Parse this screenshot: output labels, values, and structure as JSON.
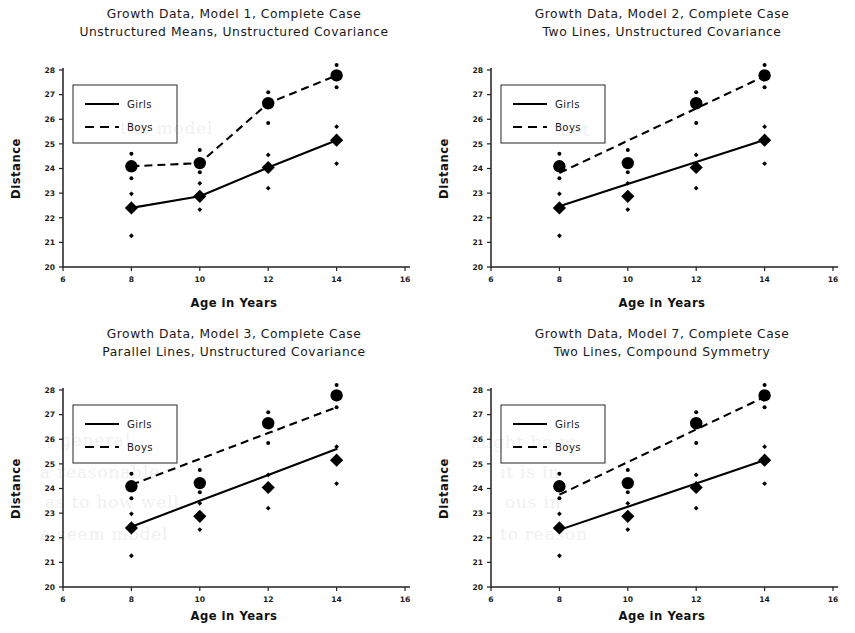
{
  "figure": {
    "background": "#ffffff",
    "ink_color": "#000000",
    "panel_count": 4
  },
  "axes_common": {
    "xlabel": "Age in Years",
    "ylabel": "Distance",
    "xticks": [
      6,
      8,
      10,
      12,
      14,
      16
    ],
    "yticks": [
      20,
      21,
      22,
      23,
      24,
      25,
      26,
      27,
      28
    ],
    "xlim": [
      6,
      16
    ],
    "ylim": [
      20,
      28
    ],
    "grid": false
  },
  "legend_common": {
    "position": "upper-left",
    "entries": [
      {
        "label": "Girls",
        "style": "solid",
        "marker": "diamond"
      },
      {
        "label": "Boys",
        "style": "dashed",
        "marker": "circle"
      }
    ]
  },
  "chart_data": [
    {
      "id": "panel-model-1",
      "type": "line",
      "title": "Growth Data, Model 1, Complete Case",
      "subtitle": "Unstructured Means, Unstructured Covariance",
      "xlabel": "Age in Years",
      "ylabel": "Distance",
      "xlim": [
        6,
        16
      ],
      "ylim": [
        20,
        28
      ],
      "xticks": [
        6,
        8,
        10,
        12,
        14,
        16
      ],
      "yticks": [
        20,
        21,
        22,
        23,
        24,
        25,
        26,
        27,
        28
      ],
      "grid": false,
      "x": [
        8,
        10,
        12,
        14
      ],
      "series": [
        {
          "name": "Girls",
          "style": "solid",
          "marker": "diamond",
          "values": [
            22.4,
            22.87,
            24.04,
            25.15
          ],
          "upper": [
            22.97,
            23.4,
            24.55,
            25.7
          ],
          "lower": [
            21.27,
            22.33,
            23.2,
            24.2
          ],
          "fitted": [
            22.4,
            22.87,
            24.04,
            25.15
          ]
        },
        {
          "name": "Boys",
          "style": "dashed",
          "marker": "circle",
          "values": [
            24.09,
            24.22,
            26.65,
            27.78
          ],
          "upper": [
            24.6,
            24.75,
            27.1,
            28.2
          ],
          "lower": [
            23.6,
            23.85,
            25.85,
            27.3
          ],
          "fitted": [
            24.09,
            24.22,
            26.65,
            27.78
          ]
        }
      ],
      "legend": {
        "position": "upper-left",
        "labels": [
          "Girls",
          "Boys"
        ]
      }
    },
    {
      "id": "panel-model-2",
      "type": "line",
      "title": "Growth Data, Model 2, Complete Case",
      "subtitle": "Two Lines, Unstructured Covariance",
      "xlabel": "Age in Years",
      "ylabel": "Distance",
      "xlim": [
        6,
        16
      ],
      "ylim": [
        20,
        28
      ],
      "xticks": [
        6,
        8,
        10,
        12,
        14,
        16
      ],
      "yticks": [
        20,
        21,
        22,
        23,
        24,
        25,
        26,
        27,
        28
      ],
      "grid": false,
      "x": [
        8,
        10,
        12,
        14
      ],
      "series": [
        {
          "name": "Girls",
          "style": "solid",
          "marker": "diamond",
          "values": [
            22.4,
            22.87,
            24.04,
            25.15
          ],
          "upper": [
            22.97,
            23.4,
            24.55,
            25.7
          ],
          "lower": [
            21.27,
            22.33,
            23.2,
            24.2
          ],
          "fitted": [
            22.47,
            23.37,
            24.26,
            25.16
          ]
        },
        {
          "name": "Boys",
          "style": "dashed",
          "marker": "circle",
          "values": [
            24.09,
            24.22,
            26.65,
            27.78
          ],
          "upper": [
            24.6,
            24.75,
            27.1,
            28.2
          ],
          "lower": [
            23.6,
            23.85,
            25.85,
            27.3
          ],
          "fitted": [
            23.82,
            25.13,
            26.44,
            27.75
          ]
        }
      ],
      "legend": {
        "position": "upper-left",
        "labels": [
          "Girls",
          "Boys"
        ]
      }
    },
    {
      "id": "panel-model-3",
      "type": "line",
      "title": "Growth Data, Model 3, Complete Case",
      "subtitle": "Parallel Lines, Unstructured Covariance",
      "xlabel": "Age in Years",
      "ylabel": "Distance",
      "xlim": [
        6,
        16
      ],
      "ylim": [
        20,
        28
      ],
      "xticks": [
        6,
        8,
        10,
        12,
        14,
        16
      ],
      "yticks": [
        20,
        21,
        22,
        23,
        24,
        25,
        26,
        27,
        28
      ],
      "grid": false,
      "x": [
        8,
        10,
        12,
        14
      ],
      "series": [
        {
          "name": "Girls",
          "style": "solid",
          "marker": "diamond",
          "values": [
            22.4,
            22.87,
            24.04,
            25.15
          ],
          "upper": [
            22.97,
            23.4,
            24.55,
            25.7
          ],
          "lower": [
            21.27,
            22.33,
            23.2,
            24.2
          ],
          "fitted": [
            22.45,
            23.5,
            24.55,
            25.6
          ]
        },
        {
          "name": "Boys",
          "style": "dashed",
          "marker": "circle",
          "values": [
            24.09,
            24.22,
            26.65,
            27.78
          ],
          "upper": [
            24.6,
            24.75,
            27.1,
            28.2
          ],
          "lower": [
            23.6,
            23.85,
            25.85,
            27.3
          ],
          "fitted": [
            24.15,
            25.2,
            26.25,
            27.3
          ]
        }
      ],
      "legend": {
        "position": "upper-left",
        "labels": [
          "Girls",
          "Boys"
        ]
      }
    },
    {
      "id": "panel-model-7",
      "type": "line",
      "title": "Growth Data, Model 7, Complete Case",
      "subtitle": "Two Lines, Compound Symmetry",
      "xlabel": "Age in Years",
      "ylabel": "Distance",
      "xlim": [
        6,
        16
      ],
      "ylim": [
        20,
        28
      ],
      "xticks": [
        6,
        8,
        10,
        12,
        14,
        16
      ],
      "yticks": [
        20,
        21,
        22,
        23,
        24,
        25,
        26,
        27,
        28
      ],
      "grid": false,
      "x": [
        8,
        10,
        12,
        14
      ],
      "series": [
        {
          "name": "Girls",
          "style": "solid",
          "marker": "diamond",
          "values": [
            22.4,
            22.87,
            24.04,
            25.15
          ],
          "upper": [
            22.97,
            23.4,
            24.55,
            25.7
          ],
          "lower": [
            21.27,
            22.33,
            23.2,
            24.2
          ],
          "fitted": [
            22.32,
            23.26,
            24.2,
            25.15
          ]
        },
        {
          "name": "Boys",
          "style": "dashed",
          "marker": "circle",
          "values": [
            24.09,
            24.22,
            26.65,
            27.78
          ],
          "upper": [
            24.6,
            24.75,
            27.1,
            28.2
          ],
          "lower": [
            23.6,
            23.85,
            25.85,
            27.3
          ],
          "fitted": [
            23.75,
            25.07,
            26.4,
            27.72
          ]
        }
      ],
      "legend": {
        "position": "upper-left",
        "labels": [
          "Girls",
          "Boys"
        ]
      }
    }
  ],
  "bleedthrough": [
    {
      "text": "the model",
      "x": 120,
      "y": 118
    },
    {
      "text": "bet",
      "x": 560,
      "y": 120
    },
    {
      "text": "general",
      "x": 60,
      "y": 430
    },
    {
      "text": "might be w",
      "x": 470,
      "y": 432
    },
    {
      "text": "a reasonable",
      "x": 40,
      "y": 462
    },
    {
      "text": "it is in",
      "x": 500,
      "y": 462
    },
    {
      "text": "as to how well",
      "x": 45,
      "y": 492
    },
    {
      "text": "ous in",
      "x": 505,
      "y": 492
    },
    {
      "text": "a seem model",
      "x": 40,
      "y": 524
    },
    {
      "text": "to reason",
      "x": 500,
      "y": 524
    }
  ]
}
